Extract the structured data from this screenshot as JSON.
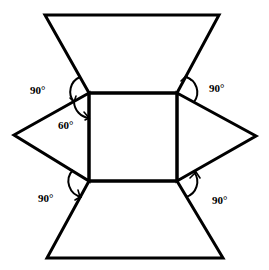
{
  "diagram": {
    "type": "net-of-solid",
    "stroke_color": "#000000",
    "background": "#ffffff",
    "faces": {
      "square": {
        "points": [
          [
            89,
            93
          ],
          [
            177,
            93
          ],
          [
            177,
            181
          ],
          [
            89,
            181
          ]
        ]
      },
      "top_trapezoid": {
        "points": [
          [
            45,
            15
          ],
          [
            219,
            15
          ],
          [
            177,
            93
          ],
          [
            89,
            93
          ]
        ]
      },
      "bottom_trapezoid": {
        "points": [
          [
            89,
            181
          ],
          [
            177,
            181
          ],
          [
            223,
            258
          ],
          [
            47,
            258
          ]
        ]
      },
      "left_triangle": {
        "points": [
          [
            89,
            93
          ],
          [
            14,
            135
          ],
          [
            89,
            181
          ]
        ]
      },
      "right_triangle": {
        "points": [
          [
            177,
            93
          ],
          [
            256,
            136
          ],
          [
            177,
            181
          ]
        ]
      }
    },
    "angle_labels": [
      {
        "id": "top-left-90",
        "text": "90°",
        "x": 30,
        "y": 94
      },
      {
        "id": "left-60",
        "text": "60°",
        "x": 58,
        "y": 129
      },
      {
        "id": "top-right-90",
        "text": "90°",
        "x": 209,
        "y": 92
      },
      {
        "id": "bottom-left-90",
        "text": "90°",
        "x": 38,
        "y": 202
      },
      {
        "id": "bottom-right-90",
        "text": "90°",
        "x": 212,
        "y": 204
      }
    ]
  }
}
